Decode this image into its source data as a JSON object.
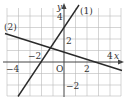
{
  "figure": {
    "x_axis_label": "x",
    "y_axis_label": "y",
    "origin_label": "O",
    "x_ticks": [
      {
        "value": -4,
        "label": "−4"
      },
      {
        "value": -2,
        "label": "−2"
      },
      {
        "value": 2,
        "label": "2"
      },
      {
        "value": 4,
        "label": "4"
      }
    ],
    "y_ticks": [
      {
        "value": 4,
        "label": "4"
      },
      {
        "value": 2,
        "label": "2"
      },
      {
        "value": -2,
        "label": "−2"
      }
    ],
    "lines": [
      {
        "label": "(1)",
        "equation": "y = 3/2 x + 3",
        "slope": 1.5,
        "intercept": 3
      },
      {
        "label": "(2)",
        "equation": "y = -1/3 x + 1",
        "slope": -0.3333,
        "intercept": 1
      }
    ],
    "grid": true,
    "x_range": [
      -5.5,
      4.9
    ],
    "y_range": [
      -3,
      4.5
    ],
    "colors": {
      "grid": "#b8b8b8",
      "axis": "#444444",
      "line": "#2a2a2a"
    }
  }
}
